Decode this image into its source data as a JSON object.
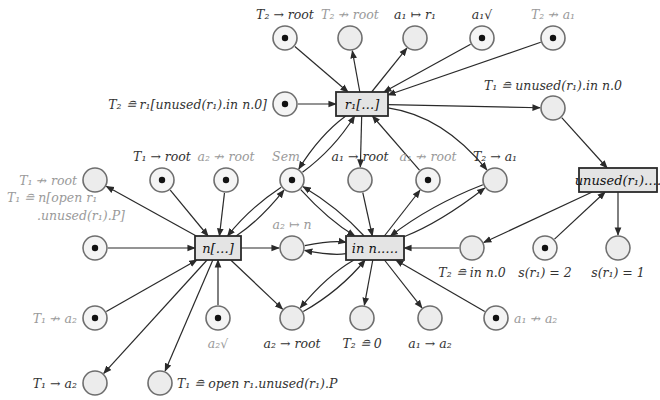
{
  "diagram": {
    "type": "petri-net",
    "transitions": [
      {
        "id": "t_r1",
        "label": "r₁[…]"
      },
      {
        "id": "t_n",
        "label": "n[…]"
      },
      {
        "id": "t_inn",
        "label": "in n.…."
      },
      {
        "id": "t_unused",
        "label": "unused(r₁)…."
      }
    ],
    "places": [
      {
        "id": "p_T2_root",
        "label": "T₂ → root",
        "marked": true
      },
      {
        "id": "p_T2_nroot",
        "label": "T₂ ↛ root",
        "marked": false,
        "faint": true
      },
      {
        "id": "p_a1_r1",
        "label": "a₁ ↦ r₁",
        "marked": false
      },
      {
        "id": "p_a1_ok",
        "label": "a₁√",
        "marked": true
      },
      {
        "id": "p_T2_na1",
        "label": "T₂ ↛ a₁",
        "marked": true,
        "faint": true
      },
      {
        "id": "p_T2_def",
        "label": "T₂ ≘ r₁[unused(r₁).in n.0]",
        "marked": true
      },
      {
        "id": "p_T1_def",
        "label": "T₁ ≘ unused(r₁).in n.0",
        "marked": false
      },
      {
        "id": "p_T1_nroot",
        "label": "T₁ ↛ root",
        "marked": false,
        "faint": true
      },
      {
        "id": "p_T1_root",
        "label": "T₁ → root",
        "marked": true
      },
      {
        "id": "p_a2_nroot",
        "label": "a₂ ↛ root",
        "marked": true,
        "faint": true
      },
      {
        "id": "p_sem",
        "label": "Sem",
        "marked": true,
        "faint": true
      },
      {
        "id": "p_a1_root",
        "label": "a₁ → root",
        "marked": false
      },
      {
        "id": "p_a1_nroot",
        "label": "a₁ ↛ root",
        "marked": true,
        "faint": true
      },
      {
        "id": "p_T2_a1",
        "label": "T₂ → a₁",
        "marked": false
      },
      {
        "id": "p_T1_n",
        "label": "T₁ ≘ n[open r₁",
        "label2": ".unused(r₁).P]",
        "marked": true,
        "faint": true
      },
      {
        "id": "p_a2_n",
        "label": "a₂ ↦ n",
        "marked": false,
        "faint": true
      },
      {
        "id": "p_T2_inn",
        "label": "T₂ ≘ in n.0",
        "marked": false
      },
      {
        "id": "p_s2",
        "label": "s(r₁) = 2",
        "marked": true
      },
      {
        "id": "p_s1",
        "label": "s(r₁) = 1",
        "marked": false
      },
      {
        "id": "p_T1_na2",
        "label": "T₁ ↛ a₂",
        "marked": true,
        "faint": true
      },
      {
        "id": "p_a2_ok",
        "label": "a₂√",
        "marked": true,
        "faint": true
      },
      {
        "id": "p_a2_root",
        "label": "a₂ → root",
        "marked": false
      },
      {
        "id": "p_T2_0",
        "label": "T₂ ≘ 0",
        "marked": false
      },
      {
        "id": "p_a1_a2",
        "label": "a₁ → a₂",
        "marked": false
      },
      {
        "id": "p_a1_na2",
        "label": "a₁ ↛ a₂",
        "marked": true,
        "faint": true
      },
      {
        "id": "p_T1_a2",
        "label": "T₁ → a₂",
        "marked": false
      },
      {
        "id": "p_T1_open",
        "label": "T₁ ≘ open r₁.unused(r₁).P",
        "marked": false
      }
    ],
    "arcs": [
      [
        "p_T2_root",
        "t_r1"
      ],
      [
        "t_r1",
        "p_T2_nroot"
      ],
      [
        "t_r1",
        "p_a1_r1"
      ],
      [
        "p_a1_ok",
        "t_r1"
      ],
      [
        "p_T2_na1",
        "t_r1"
      ],
      [
        "p_T2_def",
        "t_r1"
      ],
      [
        "t_r1",
        "p_T1_def"
      ],
      [
        "p_T1_def",
        "t_unused"
      ],
      [
        "p_sem",
        "t_r1"
      ],
      [
        "t_r1",
        "p_sem"
      ],
      [
        "t_r1",
        "p_a1_root"
      ],
      [
        "p_a1_nroot",
        "t_r1"
      ],
      [
        "t_r1",
        "p_T2_a1"
      ],
      [
        "t_n",
        "p_T1_nroot"
      ],
      [
        "p_T1_root",
        "t_n"
      ],
      [
        "p_a2_nroot",
        "t_n"
      ],
      [
        "p_sem",
        "t_n"
      ],
      [
        "t_n",
        "p_sem"
      ],
      [
        "p_T1_n",
        "t_n"
      ],
      [
        "t_n",
        "p_a2_n"
      ],
      [
        "p_a2_n",
        "t_inn"
      ],
      [
        "t_inn",
        "p_a2_n"
      ],
      [
        "p_sem",
        "t_inn"
      ],
      [
        "t_inn",
        "p_sem"
      ],
      [
        "p_a1_root",
        "t_inn"
      ],
      [
        "t_inn",
        "p_a1_nroot"
      ],
      [
        "p_T2_a1",
        "t_inn"
      ],
      [
        "t_inn",
        "p_T2_a1"
      ],
      [
        "t_unused",
        "p_T2_inn"
      ],
      [
        "p_T2_inn",
        "t_inn"
      ],
      [
        "p_s2",
        "t_unused"
      ],
      [
        "t_unused",
        "p_s1"
      ],
      [
        "p_T1_na2",
        "t_n"
      ],
      [
        "p_a2_ok",
        "t_n"
      ],
      [
        "t_n",
        "p_a2_root"
      ],
      [
        "t_n",
        "p_T1_a2"
      ],
      [
        "t_n",
        "p_T1_open"
      ],
      [
        "p_a2_root",
        "t_inn"
      ],
      [
        "t_inn",
        "p_a2_root"
      ],
      [
        "t_inn",
        "p_T2_0"
      ],
      [
        "t_inn",
        "p_a1_a2"
      ],
      [
        "p_a1_na2",
        "t_inn"
      ]
    ]
  }
}
